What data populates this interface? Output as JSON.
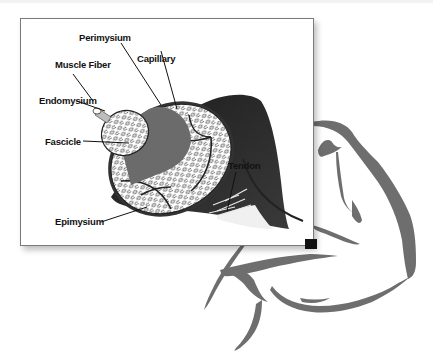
{
  "figure": {
    "labels": {
      "perimysium": "Perimysium",
      "capillary": "Capillary",
      "muscle_fiber": "Muscle Fiber",
      "endomysium": "Endomysium",
      "fascicle": "Fascicle",
      "tendon": "Tendon",
      "epimysium": "Epimysium"
    },
    "colors": {
      "muscle_dark": "#2e2e2e",
      "fascicle_gray": "#6b6b6b",
      "arm_outline": "#6e6e6e",
      "card_border": "#7a7a7a"
    }
  }
}
